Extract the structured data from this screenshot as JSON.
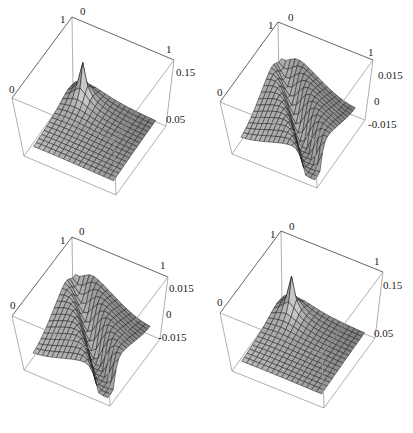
{
  "figure": {
    "layout": "2x2 grid of 3D surface plots",
    "panels": [
      {
        "id": "top-left",
        "z_ticks": [
          "0.15",
          "0.05"
        ],
        "corner_labels": {
          "back_x": "0",
          "back_y": "1",
          "right": "1",
          "left": "0"
        }
      },
      {
        "id": "top-right",
        "z_ticks": [
          "0.015",
          "0",
          "-0.015"
        ],
        "corner_labels": {
          "back_x": "0",
          "back_y": "1",
          "right": "1",
          "left": "0"
        }
      },
      {
        "id": "bottom-left",
        "z_ticks": [
          "0.015",
          "0",
          "-0.015"
        ],
        "corner_labels": {
          "back_x": "0",
          "back_y": "1",
          "right": "1",
          "left": "0"
        }
      },
      {
        "id": "bottom-right",
        "z_ticks": [
          "0.15",
          "0.05"
        ],
        "corner_labels": {
          "back_x": "0",
          "back_y": "1",
          "right": "1",
          "left": "0"
        }
      }
    ]
  },
  "chart_data": [
    {
      "type": "surface",
      "title": "",
      "x_range": [
        0,
        1
      ],
      "y_range": [
        0,
        1
      ],
      "z_ticks": [
        0.05,
        0.15
      ],
      "description": "Positive surface with sharp peak near the (0,1)-side interior, decaying outward; peak exceeds ~0.15",
      "mesh": "approx 16x16 grid"
    },
    {
      "type": "surface",
      "title": "",
      "x_range": [
        0,
        1
      ],
      "y_range": [
        0,
        1
      ],
      "z_ticks": [
        -0.015,
        0,
        0.015
      ],
      "description": "Signed surface with a deep trough/discontinuity along a line from the center toward the front corner; raised ridges at back-left and back-right",
      "mesh": "approx 16x16 grid"
    },
    {
      "type": "surface",
      "title": "",
      "x_range": [
        0,
        1
      ],
      "y_range": [
        0,
        1
      ],
      "z_ticks": [
        -0.015,
        0,
        0.015
      ],
      "description": "Signed surface nearly identical to top-right panel: trough from center toward front corner, raised ridges on back sides",
      "mesh": "approx 16x16 grid"
    },
    {
      "type": "surface",
      "title": "",
      "x_range": [
        0,
        1
      ],
      "y_range": [
        0,
        1
      ],
      "z_ticks": [
        0.05,
        0.15
      ],
      "description": "Positive surface with sharp central peak, sloping down toward the front; similar to top-left panel but mirrored shading",
      "mesh": "approx 16x16 grid"
    }
  ]
}
